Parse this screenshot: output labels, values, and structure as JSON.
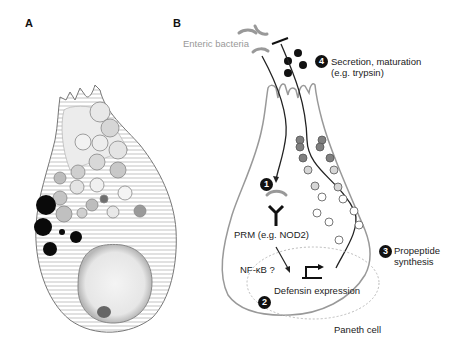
{
  "panels": {
    "a": {
      "label": "A",
      "description": "Electron micrograph drawing of a Paneth cell with secretory granules, rough ER and nucleus"
    },
    "b": {
      "label": "B",
      "description": "Schematic of Paneth cell defensin pathway"
    }
  },
  "labels": {
    "enteric_bacteria": "Enteric bacteria",
    "step4_line1": "Secretion, maturation",
    "step4_line2": "(e.g. trypsin)",
    "prm": "PRM (e.g. NOD2)",
    "nfkb": "NF-κB ?",
    "defensin": "Defensin expression",
    "step3_line1": "Propeptide",
    "step3_line2": "synthesis",
    "paneth_cell": "Paneth cell"
  },
  "steps": {
    "s1": "1",
    "s2": "2",
    "s3": "3",
    "s4": "4"
  },
  "colors": {
    "outline": "#999999",
    "dark": "#111111",
    "granule_dark": "#808080",
    "granule_light": "#d0d0d0",
    "granule_empty": "#ffffff"
  }
}
